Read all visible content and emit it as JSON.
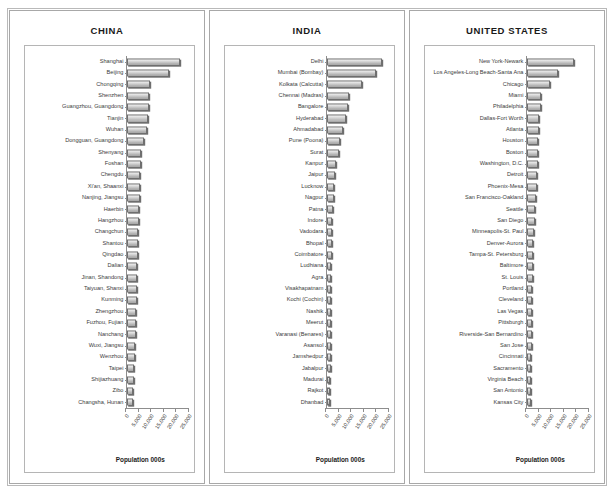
{
  "figure": {
    "axis_title": "Population 000s",
    "tick_labels": [
      "0",
      "5,000",
      "10,000",
      "15,000",
      "20,000",
      "25,000"
    ],
    "tick_values": [
      0,
      5000,
      10000,
      15000,
      20000,
      25000
    ],
    "bar_fill": "#cfcfcf",
    "bar_edge": "#6f6f6f",
    "frame_color": "#b9b9b9"
  },
  "chart_data": [
    {
      "type": "bar",
      "orientation": "horizontal",
      "title": "CHINA",
      "xlabel": "Population 000s",
      "ylabel": "",
      "xlim": [
        0,
        25000
      ],
      "grid": false,
      "legend": "none",
      "categories": [
        "Shanghai",
        "Beijing",
        "Chongqing",
        "Shenzhen",
        "Guangzhou, Guangdong",
        "Tianjin",
        "Wuhan",
        "Dongguan, Guangdong",
        "Shenyang",
        "Foshan",
        "Chengdu",
        "Xi'an, Shaanxi",
        "Nanjing, Jiangsu",
        "Haerbin",
        "Hangzhou",
        "Changchun",
        "Shantou",
        "Qingdao",
        "Dalian",
        "Jinan, Shandong",
        "Taiyuan, Shanxi",
        "Kunming",
        "Zhengzhou",
        "Fuzhou, Fujian",
        "Nanchang",
        "Wuxi, Jiangsu",
        "Wenzhou",
        "Taipei",
        "Shijiazhuang",
        "Zibo",
        "Changsha, Hunan"
      ],
      "values": [
        21500,
        17300,
        9400,
        9000,
        8800,
        8500,
        8200,
        6800,
        5800,
        5600,
        5300,
        5100,
        5000,
        4700,
        4600,
        4400,
        4300,
        4200,
        4100,
        4000,
        3900,
        3800,
        3700,
        3600,
        3400,
        3100,
        3000,
        2700,
        2600,
        2500,
        2400
      ]
    },
    {
      "type": "bar",
      "orientation": "horizontal",
      "title": "INDIA",
      "xlabel": "Population 000s",
      "ylabel": "",
      "xlim": [
        0,
        25000
      ],
      "grid": false,
      "legend": "none",
      "categories": [
        "Delhi",
        "Mumbai (Bombay)",
        "Kolkata (Calcutta)",
        "Chennai (Madras)",
        "Bangalore",
        "Hyderabad",
        "Ahmadabad",
        "Pune (Poona)",
        "Surat",
        "Kanpur",
        "Jaipur",
        "Lucknow",
        "Nagpur",
        "Patna",
        "Indore",
        "Vadodara",
        "Bhopal",
        "Coimbatore",
        "Ludhiana",
        "Agra",
        "Visakhapatnam",
        "Kochi (Cochin)",
        "Nashik",
        "Meerut",
        "Varanasi (Benares)",
        "Asansol",
        "Jamshedpur",
        "Jabalpur",
        "Madurai",
        "Rajkot",
        "Dhanbad"
      ],
      "values": [
        22700,
        20000,
        14300,
        8900,
        8500,
        7800,
        6400,
        5000,
        4600,
        3400,
        3100,
        2900,
        2600,
        2200,
        2100,
        1900,
        1800,
        1700,
        1650,
        1650,
        1600,
        1600,
        1550,
        1500,
        1450,
        1400,
        1350,
        1300,
        1250,
        1200,
        1200
      ]
    },
    {
      "type": "bar",
      "orientation": "horizontal",
      "title": "UNITED STATES",
      "xlabel": "Population 000s",
      "ylabel": "",
      "xlim": [
        0,
        25000
      ],
      "grid": false,
      "legend": "none",
      "categories": [
        "New York-Newark",
        "Los Angeles-Long Beach-Santa Ana",
        "Chicago",
        "Miami",
        "Philadelphia",
        "Dallas-Fort Worth",
        "Atlanta",
        "Houston",
        "Boston",
        "Washington, D.C.",
        "Detroit",
        "Phoenix-Mesa",
        "San Francisco-Oakland",
        "Seattle",
        "San Diego",
        "Minneapolis-St. Paul",
        "Denver-Aurora",
        "Tampa-St. Petersburg",
        "Baltimore",
        "St. Louis",
        "Portland",
        "Cleveland",
        "Las Vegas",
        "Pittsburgh",
        "Riverside-San Bernardino",
        "San Jose",
        "Cincinnati",
        "Sacramento",
        "Virginia Beach",
        "San Antonio",
        "Kansas City"
      ],
      "values": [
        19400,
        12800,
        9500,
        5600,
        5500,
        4900,
        4600,
        4500,
        4400,
        4300,
        4000,
        3900,
        3500,
        3200,
        3000,
        2700,
        2400,
        2400,
        2300,
        2200,
        2000,
        1900,
        1900,
        1800,
        1800,
        1700,
        1650,
        1600,
        1500,
        1450,
        1400
      ]
    }
  ]
}
